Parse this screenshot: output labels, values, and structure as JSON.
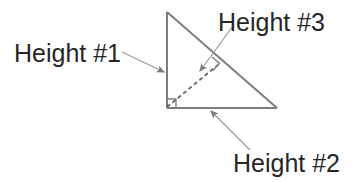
{
  "figure": {
    "background_color": "#ffffff",
    "line_color": "#7d7d7d",
    "text_color": "#262626",
    "width": 363,
    "height": 182
  },
  "shape": {
    "name": "right-triangle",
    "vertices": {
      "apex": {
        "x": 167,
        "y": 12
      },
      "bottom_left": {
        "x": 167,
        "y": 108
      },
      "bottom_right": {
        "x": 277,
        "y": 108
      }
    },
    "right_angle_marker_at": "bottom_left",
    "altitude": {
      "name": "dashed-altitude",
      "style": "dashed",
      "from": {
        "x": 167,
        "y": 108
      },
      "to": {
        "x": 219,
        "y": 64
      },
      "right_angle_marker_at_hypotenuse": true
    }
  },
  "labels": {
    "height1": {
      "text": "Height #1",
      "x": 14,
      "y": 62,
      "refers_to": "left-vertical-side"
    },
    "height2": {
      "text": "Height #2",
      "x": 233,
      "y": 172,
      "refers_to": "bottom-horizontal-side"
    },
    "height3": {
      "text": "Height #3",
      "x": 218,
      "y": 31,
      "refers_to": "dashed-altitude-to-hypotenuse"
    }
  },
  "leader_lines": {
    "height1_arrow": {
      "name": "arrow-to-left-side",
      "from": {
        "x": 122,
        "y": 52
      },
      "to": {
        "x": 165,
        "y": 72
      }
    },
    "height2_arrow": {
      "name": "arrow-to-bottom-side",
      "from": {
        "x": 249,
        "y": 149
      },
      "to": {
        "x": 211,
        "y": 111
      }
    },
    "height3_arrow": {
      "name": "arrow-to-altitude",
      "from": {
        "x": 232,
        "y": 27
      },
      "to": {
        "x": 200,
        "y": 72
      }
    }
  }
}
